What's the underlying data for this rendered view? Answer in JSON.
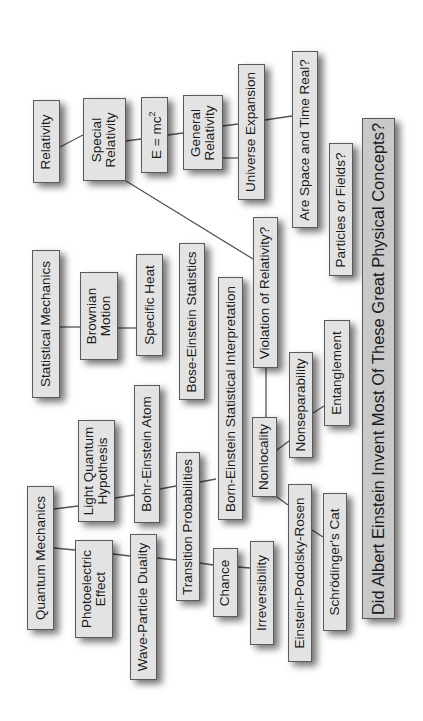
{
  "diagram": {
    "title": "Did Albert Einstein Invent Most Of These Great Physical Concepts?",
    "orientation": "rotated 90° counter-clockwise (text reads bottom-to-top)",
    "colors": {
      "background": "#ffffff",
      "node_fill": "#e3e3e3",
      "title_fill": "#c9c9c9",
      "border": "#5a5a5a",
      "connector": "#555555"
    },
    "nodes": {
      "relativity": "Relativity",
      "special_relativity_1": "Special",
      "special_relativity_2": "Relativity",
      "emc2_base": "E = mc",
      "emc2_exp": "2",
      "general_relativity_1": "General",
      "general_relativity_2": "Relativity",
      "universe_expansion": "Universe Expansion",
      "space_time_real": "Are Space and Time Real?",
      "particles_or_fields": "Particles or Fields?",
      "statistical_mechanics": "Statistical Mechanics",
      "brownian_motion_1": "Brownian",
      "brownian_motion_2": "Motion",
      "specific_heat": "Specific Heat",
      "bose_einstein_statistics": "Bose-Einstein Statistics",
      "born_einstein_interpretation": "Born-Einstein Statistical Interpretation",
      "violation_of_relativity": "Violation of Relativity?",
      "nonlocality": "Nonlocality",
      "nonseparability": "Nonseparability",
      "entanglement": "Entanglement",
      "quantum_mechanics": "Quantum Mechanics",
      "light_quantum_1": "Light Quantum",
      "light_quantum_2": "Hypothesis",
      "bohr_einstein_atom": "Bohr-Einstein Atom",
      "photoelectric_1": "Photoelectric",
      "photoelectric_2": "Effect",
      "wave_particle_duality": "Wave-Particle Duality",
      "transition_probabilities": "Transition Probabilities",
      "chance": "Chance",
      "irreversibility": "Irreversibility",
      "epr": "Einstein-Podolsky-Rosen",
      "schrodingers_cat": "Schrödinger's Cat"
    },
    "edges": [
      [
        "Relativity",
        "Special Relativity"
      ],
      [
        "Special Relativity",
        "E = mc2"
      ],
      [
        "E = mc2",
        "General Relativity"
      ],
      [
        "General Relativity",
        "Universe Expansion"
      ],
      [
        "General Relativity",
        "Universe Expansion"
      ],
      [
        "Universe Expansion",
        "Are Space and Time Real?"
      ],
      [
        "Special Relativity",
        "Violation of Relativity?"
      ],
      [
        "Violation of Relativity?",
        "Nonlocality"
      ],
      [
        "Nonlocality",
        "Nonseparability"
      ],
      [
        "Nonseparability",
        "Entanglement"
      ],
      [
        "Nonlocality",
        "Einstein-Podolsky-Rosen"
      ],
      [
        "Einstein-Podolsky-Rosen",
        "Schrödinger's Cat"
      ],
      [
        "Statistical Mechanics",
        "Brownian Motion"
      ],
      [
        "Brownian Motion",
        "Specific Heat"
      ],
      [
        "Quantum Mechanics",
        "Light Quantum Hypothesis"
      ],
      [
        "Light Quantum Hypothesis",
        "Bohr-Einstein Atom"
      ],
      [
        "Bohr-Einstein Atom",
        "Transition Probabilities"
      ],
      [
        "Transition Probabilities",
        "Born-Einstein Statistical Interpretation"
      ],
      [
        "Quantum Mechanics",
        "Photoelectric Effect"
      ],
      [
        "Photoelectric Effect",
        "Wave-Particle Duality"
      ],
      [
        "Wave-Particle Duality",
        "Transition Probabilities"
      ],
      [
        "Transition Probabilities",
        "Chance"
      ],
      [
        "Chance",
        "Irreversibility"
      ]
    ]
  }
}
